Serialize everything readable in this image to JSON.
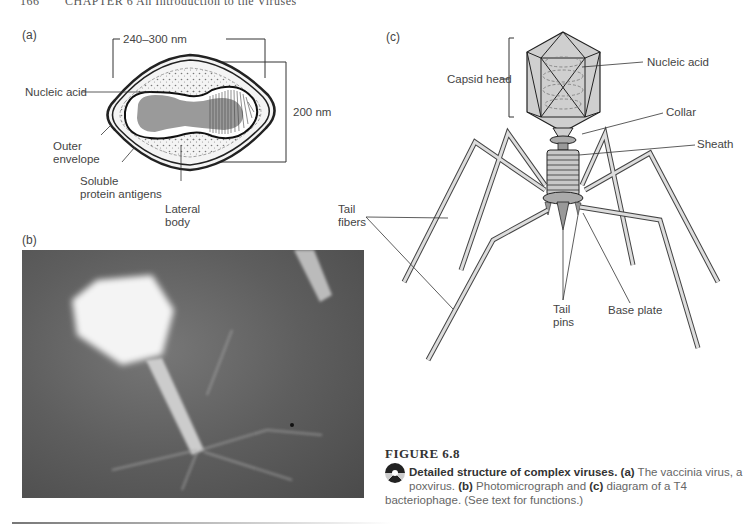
{
  "running_head": {
    "page": "166",
    "text": "CHAPTER 6  An Introduction to the Viruses"
  },
  "panel_a": {
    "label": "(a)",
    "width_dim": "240–300 nm",
    "height_dim": "200 nm",
    "labels": {
      "nucleic_acid": "Nucleic acid",
      "outer_envelope_1": "Outer",
      "outer_envelope_2": "envelope",
      "soluble_1": "Soluble",
      "soluble_2": "protein antigens",
      "lateral_1": "Lateral",
      "lateral_2": "body"
    }
  },
  "panel_b": {
    "label": "(b)"
  },
  "panel_c": {
    "label": "(c)",
    "labels": {
      "capsid_head": "Capsid head",
      "nucleic_acid": "Nucleic acid",
      "collar": "Collar",
      "sheath": "Sheath",
      "tail_fibers_1": "Tail",
      "tail_fibers_2": "fibers",
      "tail_pins_1": "Tail",
      "tail_pins_2": "pins",
      "base_plate": "Base plate"
    }
  },
  "figure": {
    "title": "FIGURE 6.8",
    "caption_bold_1": "Detailed structure of complex viruses.",
    "caption_bold_a": "(a)",
    "caption_1": " The vaccinia virus, a poxvirus. ",
    "caption_bold_b": "(b)",
    "caption_2": " Photomicrograph and ",
    "caption_bold_c": "(c)",
    "caption_3": " diagram of a T4 bacteriophage. (See text for functions.)"
  }
}
